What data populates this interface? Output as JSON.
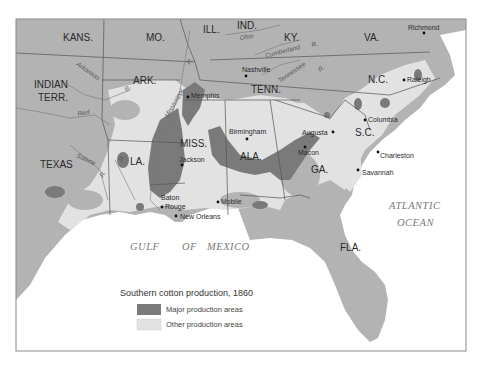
{
  "map": {
    "title": "Southern cotton production, 1860",
    "colors": {
      "land": "#b3b3b3",
      "other_production": "#e2e2e2",
      "major_production": "#7a7a7a",
      "water": "#ffffff",
      "border": "#555555",
      "frame": "#8a8a8a"
    },
    "states": {
      "kans": "KANS.",
      "mo": "MO.",
      "ill": "ILL.",
      "ind": "IND.",
      "ky": "KY.",
      "va": "VA.",
      "indian_terr_1": "INDIAN",
      "indian_terr_2": "TERR.",
      "ark": "ARK.",
      "tenn": "TENN.",
      "nc": "N.C.",
      "sc": "S.C.",
      "texas": "TEXAS",
      "la": "LA.",
      "miss": "MISS.",
      "ala": "ALA.",
      "ga": "GA.",
      "fla": "FLA."
    },
    "cities": {
      "richmond": "Richmond",
      "raleigh": "Raleigh",
      "nashville": "Nashville",
      "memphis": "Memphis",
      "columbia": "Columbia",
      "birmingham": "Birmingham",
      "augusta": "Augusta",
      "macon": "Macon",
      "charleston": "Charleston",
      "savannah": "Savannah",
      "jackson": "Jackson",
      "baton_rouge_1": "Baton",
      "baton_rouge_2": "Rouge",
      "new_orleans": "New Orleans",
      "mobile": "Mobile"
    },
    "rivers": {
      "ohio": "Ohio",
      "ohio_r": "R.",
      "cumberland": "Cumberland",
      "cumberland_r": "R.",
      "tennessee": "Tennessee",
      "tennessee_r": "R.",
      "arkansas": "Arkansas",
      "arkansas_r": "R.",
      "red": "Red",
      "red_r": "R.",
      "mississippi": "Mississippi",
      "mississippi_r": "R.",
      "sabine": "Sabine",
      "sabine_r": "R.",
      "la_r": "R."
    },
    "water_bodies": {
      "gulf_1": "GULF",
      "gulf_2": "OF",
      "gulf_3": "MEXICO",
      "atlantic_1": "ATLANTIC",
      "atlantic_2": "OCEAN"
    },
    "legend": {
      "title": "Southern cotton production, 1860",
      "items": [
        {
          "label": "Major production areas",
          "color": "#7a7a7a"
        },
        {
          "label": "Other production areas",
          "color": "#e2e2e2"
        }
      ]
    }
  }
}
